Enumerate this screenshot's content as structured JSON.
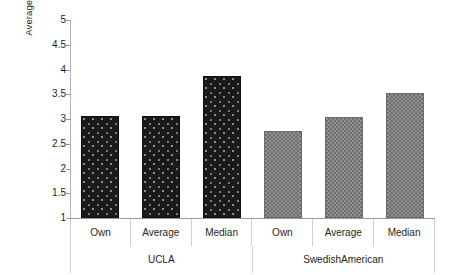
{
  "chart_data": {
    "type": "bar",
    "title": "",
    "xlabel": "",
    "ylabel": "Average rating of portfolio",
    "ylim": [
      1,
      5
    ],
    "ytick_labels": [
      "5",
      "4.5",
      "4",
      "3.5",
      "3",
      "2.5",
      "2",
      "1.5",
      "1"
    ],
    "ytick_values": [
      5,
      4.5,
      4,
      3.5,
      3,
      2.5,
      2,
      1.5,
      1
    ],
    "grid": false,
    "legend": "none",
    "groups": [
      "UCLA",
      "SwedishAmerican"
    ],
    "categories": [
      "Own",
      "Average",
      "Median"
    ],
    "series": [
      {
        "name": "UCLA",
        "color": "#1a1a1a",
        "pattern": "dotted-dark",
        "values": [
          3.07,
          3.06,
          3.87
        ]
      },
      {
        "name": "SwedishAmerican",
        "color": "#8f8f8f",
        "pattern": "checkered-gray",
        "values": [
          2.76,
          3.04,
          3.53
        ]
      }
    ],
    "bars": [
      {
        "group": "UCLA",
        "category": "Own",
        "value": 3.07,
        "style": "dark"
      },
      {
        "group": "UCLA",
        "category": "Average",
        "value": 3.06,
        "style": "dark"
      },
      {
        "group": "UCLA",
        "category": "Median",
        "value": 3.87,
        "style": "dark"
      },
      {
        "group": "SwedishAmerican",
        "category": "Own",
        "value": 2.76,
        "style": "gray"
      },
      {
        "group": "SwedishAmerican",
        "category": "Average",
        "value": 3.04,
        "style": "gray"
      },
      {
        "group": "SwedishAmerican",
        "category": "Median",
        "value": 3.53,
        "style": "gray"
      }
    ],
    "category_row": [
      "Own",
      "Average",
      "Median",
      "Own",
      "Average",
      "Median"
    ],
    "group_row": [
      "UCLA",
      "SwedishAmerican"
    ]
  }
}
